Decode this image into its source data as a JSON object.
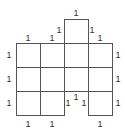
{
  "diagram": {
    "type": "unit-square net / polyomino with edge labels",
    "line_color": "#555555",
    "grid": {
      "origin_x": 16,
      "origin_y": 19,
      "cell_size": 24
    },
    "cells": [
      {
        "col": 2,
        "row": 0
      },
      {
        "col": 0,
        "row": 1
      },
      {
        "col": 1,
        "row": 1
      },
      {
        "col": 2,
        "row": 1
      },
      {
        "col": 3,
        "row": 1
      },
      {
        "col": 0,
        "row": 2
      },
      {
        "col": 1,
        "row": 2
      },
      {
        "col": 2,
        "row": 2
      },
      {
        "col": 3,
        "row": 2
      },
      {
        "col": 0,
        "row": 3
      },
      {
        "col": 1,
        "row": 3
      },
      {
        "col": 3,
        "row": 3
      }
    ],
    "labels": [
      {
        "text": "1",
        "x": 76,
        "y": 13
      },
      {
        "text": "1",
        "x": 59,
        "y": 30
      },
      {
        "text": "1",
        "x": 92,
        "y": 30
      },
      {
        "text": "1",
        "x": 28,
        "y": 38
      },
      {
        "text": "1",
        "x": 52,
        "y": 38
      },
      {
        "text": "1",
        "x": 100,
        "y": 38
      },
      {
        "text": "1",
        "x": 9,
        "y": 55
      },
      {
        "text": "1",
        "x": 118,
        "y": 55
      },
      {
        "text": "1",
        "x": 9,
        "y": 79
      },
      {
        "text": "1",
        "x": 118,
        "y": 79
      },
      {
        "text": "1",
        "x": 9,
        "y": 103
      },
      {
        "text": "1",
        "x": 68,
        "y": 103
      },
      {
        "text": "1",
        "x": 76,
        "y": 97
      },
      {
        "text": "1",
        "x": 84,
        "y": 103
      },
      {
        "text": "1",
        "x": 118,
        "y": 103
      },
      {
        "text": "1",
        "x": 28,
        "y": 124
      },
      {
        "text": "1",
        "x": 52,
        "y": 124
      },
      {
        "text": "1",
        "x": 100,
        "y": 124
      }
    ]
  }
}
